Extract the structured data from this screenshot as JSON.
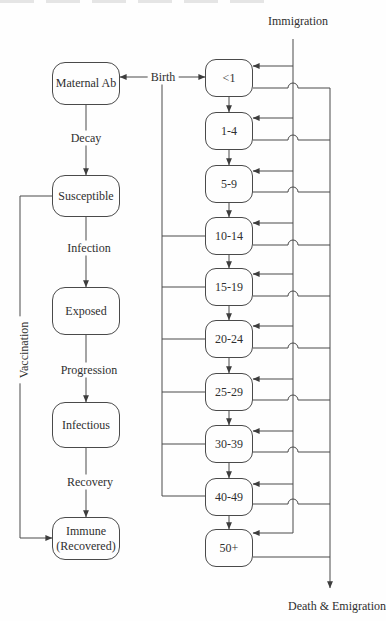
{
  "colors": {
    "line": "#4a4a4a",
    "text": "#2f2f2f",
    "background": "#fefefe"
  },
  "compartments": [
    {
      "label": "Maternal Ab"
    },
    {
      "label": "Susceptible"
    },
    {
      "label": "Exposed"
    },
    {
      "label": "Infectious"
    },
    {
      "label": "Immune",
      "label2": "(Recovered)"
    }
  ],
  "flow_labels": {
    "decay": "Decay",
    "infection": "Infection",
    "progression": "Progression",
    "recovery": "Recovery",
    "vaccination": "Vaccination",
    "birth": "Birth"
  },
  "age_groups": [
    "<1",
    "1-4",
    "5-9",
    "10-14",
    "15-19",
    "20-24",
    "25-29",
    "30-39",
    "40-49",
    "50+"
  ],
  "external_flows": {
    "immigration": "Immigration",
    "death_emigration": "Death & Emigration"
  }
}
